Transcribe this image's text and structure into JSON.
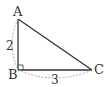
{
  "diagram": {
    "type": "right-triangle",
    "vertices": {
      "A": {
        "label": "A",
        "x": 18,
        "y": 19
      },
      "B": {
        "label": "B",
        "x": 18,
        "y": 70
      },
      "C": {
        "label": "C",
        "x": 92,
        "y": 70
      }
    },
    "right_angle_at": "B",
    "sides": {
      "AB": {
        "length_label": "2"
      },
      "BC": {
        "length_label": "3"
      }
    },
    "colors": {
      "stroke": "#333333",
      "dashed": "#999999"
    }
  }
}
